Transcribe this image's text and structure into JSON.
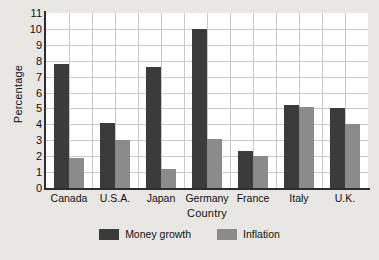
{
  "chart_data": {
    "type": "bar",
    "title": "",
    "xlabel": "Country",
    "ylabel": "Percentage",
    "categories": [
      "Canada",
      "U.S.A.",
      "Japan",
      "Germany",
      "France",
      "Italy",
      "U.K."
    ],
    "series": [
      {
        "name": "Money growth",
        "color": "#3b3b3b",
        "values": [
          7.8,
          4.1,
          7.6,
          10.0,
          2.3,
          5.2,
          5.0
        ]
      },
      {
        "name": "Inflation",
        "color": "#8b8b8b",
        "values": [
          1.9,
          3.0,
          1.2,
          3.1,
          2.0,
          5.1,
          4.0
        ]
      }
    ],
    "ylim": [
      0,
      11
    ],
    "yticks": [
      0,
      1,
      2,
      3,
      4,
      5,
      6,
      7,
      8,
      9,
      10,
      11
    ],
    "ytick_labels": [
      "0",
      "1",
      "2",
      "3",
      "4",
      "5",
      "6",
      "7",
      "8",
      "9",
      "10",
      "11"
    ],
    "grid": true,
    "grid_axes": "both",
    "legend_position": "bottom-center",
    "plot_background": "#ffffff",
    "figure_background": "#e9e7e3",
    "grid_color": "#c9c9c9",
    "axis_color": "#2e2e2e"
  }
}
